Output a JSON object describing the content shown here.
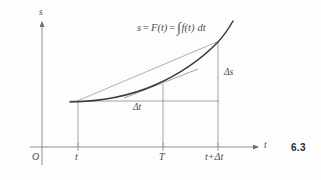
{
  "figure": {
    "number": "6.3",
    "equation": {
      "lhs": "s",
      "eq1": "=",
      "fn": "F(t)",
      "eq2": "=",
      "integral": "∫",
      "integrand": "f(t)",
      "differential": "dt",
      "full_text": "s = F(t) = ∫ f(t) dt"
    },
    "axes": {
      "y_label": "s",
      "x_label": "t",
      "origin_label": "O"
    },
    "x_ticks": [
      {
        "label": "t",
        "x": 78
      },
      {
        "label": "T",
        "x": 163
      },
      {
        "label": "t+Δt",
        "x": 218
      }
    ],
    "annotations": [
      {
        "name": "delta-s",
        "label": "Δs",
        "x": 224,
        "y": 72
      },
      {
        "name": "delta-t",
        "label": "Δt",
        "x": 136,
        "y": 107
      }
    ],
    "colors": {
      "ink": "#4a4a4a",
      "curve": "#3a3a3a",
      "thin_line": "#8a8a8a",
      "paper": "#fdfdfd",
      "fig_num": "#2a2a2a"
    },
    "geometry": {
      "y_axis_x": 42,
      "x_axis_y": 147,
      "y_axis_top": 18,
      "y_axis_bottom": 165,
      "x_axis_right": 262,
      "point_t": {
        "x": 78,
        "y": 101
      },
      "point_T": {
        "x": 163,
        "y": 84
      },
      "point_t_dt": {
        "x": 218,
        "y": 42
      },
      "curve_path": "M 70,102 C 100,101 132,95 156,84 C 180,73 202,58 218,42 C 224,36 229,28 233,21",
      "secant_from": {
        "x": 78,
        "y": 101
      },
      "secant_to": {
        "x": 218,
        "y": 42
      },
      "tangent_from": {
        "x": 126,
        "y": 97
      },
      "tangent_to": {
        "x": 196,
        "y": 70
      },
      "level_line_from": {
        "x": 70,
        "y": 101
      },
      "level_line_to": {
        "x": 218,
        "y": 101
      }
    }
  }
}
